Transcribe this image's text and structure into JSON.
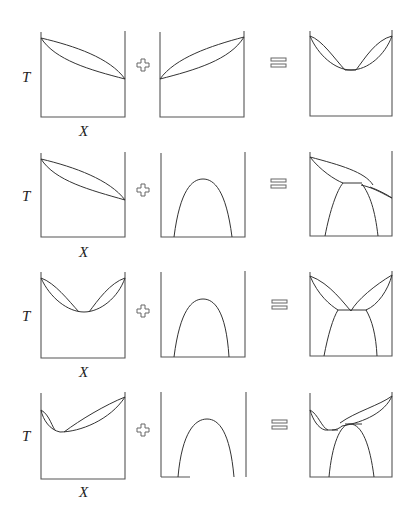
{
  "figure": {
    "axis_labels": {
      "y": "T",
      "x": "X"
    },
    "operators": {
      "plus": "+",
      "equals": "="
    },
    "rows": [
      {
        "left": "lens (cigar) descending L to R",
        "middle": "lens (cigar) ascending L to R",
        "result": "double lens with minimum (azeotrope)"
      },
      {
        "left": "lens (cigar) descending L to R",
        "middle": "miscibility gap dome",
        "result": "peritectic-type diagram"
      },
      {
        "left": "double lens with minimum",
        "middle": "miscibility gap dome",
        "result": "eutectic-type diagram"
      },
      {
        "left": "asymmetric double lens with minimum",
        "middle": "miscibility gap dome",
        "result": "combined diagram"
      }
    ]
  }
}
